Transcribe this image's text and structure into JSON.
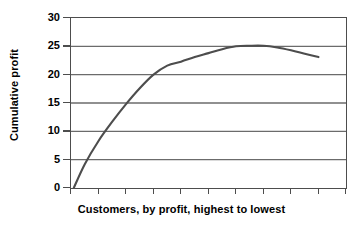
{
  "chart_data": {
    "type": "line",
    "title": "",
    "xlabel": "Customers, by profit, highest to lowest",
    "ylabel": "Cumulative profit",
    "ylim": [
      0,
      30
    ],
    "ytick_labels": [
      "0",
      "5",
      "10",
      "15",
      "20",
      "25",
      "30"
    ],
    "ytick_values": [
      0,
      5,
      10,
      15,
      20,
      25,
      30
    ],
    "xtick_labels": [
      "",
      "",
      "",
      "",
      "",
      "",
      "",
      "",
      "",
      ""
    ],
    "xlim": [
      0,
      10
    ],
    "grid": "horizontal",
    "legend": "none",
    "series": [
      {
        "name": "Cumulative profit",
        "color": "#4d4d4d",
        "x": [
          0.1,
          0.5,
          1.0,
          1.5,
          2.0,
          2.5,
          3.0,
          3.5,
          4.0,
          4.5,
          5.0,
          5.5,
          6.0,
          6.5,
          7.0,
          7.5,
          8.0,
          8.5,
          9.0
        ],
        "values": [
          0,
          4.2,
          8.3,
          11.7,
          14.8,
          17.6,
          20.0,
          21.6,
          22.3,
          23.1,
          23.8,
          24.5,
          25.0,
          25.1,
          25.1,
          24.8,
          24.3,
          23.7,
          23.1
        ]
      }
    ]
  },
  "axes": {
    "y_title": "Cumulative profit",
    "x_title": "Customers, by profit, highest to lowest"
  },
  "style": {
    "line_color": "#4d4d4d",
    "grid_color": "#6b6b6b",
    "frame_color": "#4d4d4d",
    "text_color": "#000000",
    "background": "#ffffff"
  }
}
